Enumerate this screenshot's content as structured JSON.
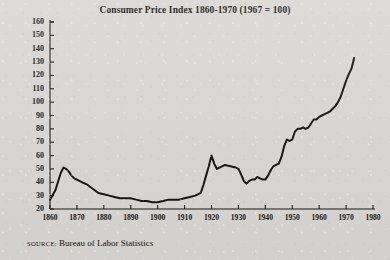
{
  "figure": {
    "title": "Consumer Price Index 1860-1970 (1967 = 100)",
    "source_label": "SOURCE:",
    "source_text": "Bureau of Labor Statistics",
    "line_color": "#100e0c",
    "paper_color": "#d9d7d3",
    "axis_color": "#17150f"
  },
  "chart_data": {
    "type": "line",
    "title": "Consumer Price Index 1860-1970 (1967 = 100)",
    "xlabel": "",
    "ylabel": "",
    "xlim": [
      1860,
      1980
    ],
    "ylim": [
      20,
      160
    ],
    "grid": false,
    "legend": null,
    "yticks": [
      20,
      30,
      40,
      50,
      60,
      70,
      80,
      90,
      100,
      110,
      120,
      130,
      140,
      150,
      160
    ],
    "xticks": [
      1860,
      1870,
      1880,
      1890,
      1900,
      1910,
      1920,
      1930,
      1940,
      1950,
      1960,
      1970,
      1980
    ],
    "ytick_labels": [
      "20",
      "30",
      "40",
      "50",
      "60",
      "70",
      "80",
      "90",
      "100",
      "110",
      "120",
      "130",
      "140",
      "150",
      "160"
    ],
    "xtick_labels": [
      "1860",
      "1870",
      "1880",
      "1890",
      "1900",
      "1910",
      "1920",
      "1930",
      "1940",
      "1950",
      "1960",
      "1970",
      "1980"
    ],
    "series": [
      {
        "name": "Consumer Price Index",
        "x": [
          1860,
          1862,
          1864,
          1865,
          1866,
          1867,
          1868,
          1869,
          1870,
          1872,
          1874,
          1876,
          1878,
          1880,
          1882,
          1884,
          1886,
          1888,
          1890,
          1892,
          1894,
          1896,
          1898,
          1900,
          1902,
          1904,
          1906,
          1908,
          1910,
          1912,
          1914,
          1916,
          1917,
          1918,
          1919,
          1920,
          1921,
          1922,
          1923,
          1925,
          1927,
          1929,
          1930,
          1931,
          1932,
          1933,
          1934,
          1935,
          1936,
          1937,
          1938,
          1939,
          1940,
          1941,
          1942,
          1943,
          1944,
          1945,
          1946,
          1947,
          1948,
          1949,
          1950,
          1951,
          1952,
          1953,
          1954,
          1955,
          1956,
          1957,
          1958,
          1959,
          1960,
          1961,
          1962,
          1963,
          1964,
          1965,
          1966,
          1967,
          1968,
          1969,
          1970,
          1971,
          1972,
          1973
        ],
        "y": [
          27,
          34,
          47,
          51,
          50,
          48,
          45,
          43,
          42,
          40,
          38,
          35,
          32,
          31,
          30,
          29,
          28,
          28,
          28,
          27,
          26,
          26,
          25,
          25,
          26,
          27,
          27,
          27,
          28,
          29,
          30,
          32,
          38,
          45,
          52,
          60,
          54,
          50,
          51,
          53,
          52,
          51,
          50,
          46,
          41,
          39,
          41,
          42,
          42,
          44,
          43,
          42,
          42,
          45,
          49,
          52,
          53,
          54,
          59,
          67,
          72,
          71,
          72,
          78,
          80,
          80,
          81,
          80,
          81,
          84,
          87,
          87,
          89,
          90,
          91,
          92,
          93,
          95,
          97,
          100,
          104,
          110,
          116,
          121,
          125,
          133
        ],
        "color": "#100e0c",
        "linewidth": 2.0
      }
    ],
    "annotations": [
      {
        "text": "Civil War peak",
        "x": 1865,
        "y": 51
      },
      {
        "text": "World War I peak",
        "x": 1920,
        "y": 60
      },
      {
        "text": "Great Depression trough",
        "x": 1933,
        "y": 39
      }
    ]
  }
}
